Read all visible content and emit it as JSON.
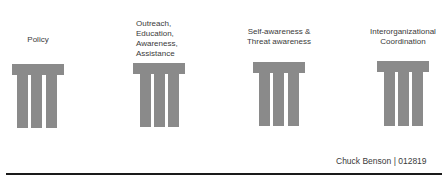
{
  "pillars": [
    {
      "label": "Policy"
    },
    {
      "label": "Outreach,\nEducation,\nAwareness,\nAssistance"
    },
    {
      "label": "Self-awareness &\nThreat awareness"
    },
    {
      "label": "Interorganizational\nCoordination"
    }
  ],
  "labels": {
    "p1": "Policy",
    "p2_l1": "Outreach,",
    "p2_l2": "Education,",
    "p2_l3": "Awareness,",
    "p2_l4": "Assistance",
    "p3_l1": "Self-awareness &",
    "p3_l2": "Threat awareness",
    "p4_l1": "Interorganizational",
    "p4_l2": "Coordination"
  },
  "footer": {
    "credit": "Chuck Benson | 012819"
  },
  "colors": {
    "pillar": "#8a8a8a",
    "rule": "#1a1a1a"
  }
}
